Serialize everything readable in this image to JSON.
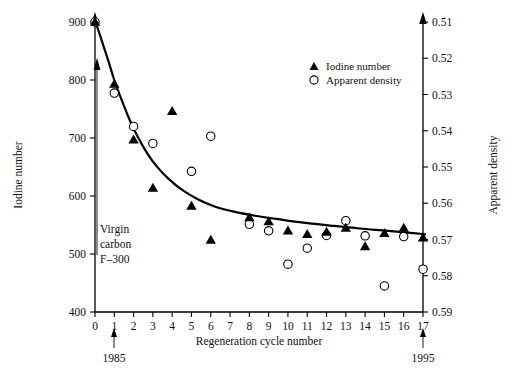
{
  "chart_data": {
    "type": "scatter",
    "title": "",
    "xlabel": "Regeneration cycle number",
    "ylabel": "Iodine number",
    "y2label": "Apparent density",
    "xlim": [
      0,
      17
    ],
    "ylim": [
      400,
      900
    ],
    "y2lim": [
      0.51,
      0.59
    ],
    "y2_inverted": true,
    "grid": false,
    "legend_position": "top-right",
    "x_ticks": [
      "0",
      "1",
      "2",
      "3",
      "4",
      "5",
      "6",
      "7",
      "8",
      "9",
      "10",
      "11",
      "12",
      "13",
      "14",
      "15",
      "16",
      "17"
    ],
    "y_ticks": [
      "400",
      "500",
      "600",
      "700",
      "800",
      "900"
    ],
    "y2_ticks": [
      "0.51",
      "0.52",
      "0.53",
      "0.54",
      "0.55",
      "0.56",
      "0.57",
      "0.58",
      "0.59"
    ],
    "series": [
      {
        "name": "Iodine number",
        "marker": "filled-triangle",
        "axis": "left",
        "x": [
          0,
          1,
          2,
          3,
          4,
          5,
          6,
          8,
          9,
          10,
          11,
          12,
          13,
          14,
          15,
          16,
          17
        ],
        "values": [
          900,
          793,
          697,
          614,
          746,
          583,
          524,
          563,
          556,
          540,
          534,
          538,
          545,
          513,
          536,
          545,
          528
        ]
      },
      {
        "name": "Apparent density",
        "marker": "open-circle",
        "axis": "right",
        "x": [
          0,
          1,
          2,
          3,
          5,
          6,
          8,
          9,
          10,
          11,
          12,
          13,
          14,
          15,
          16,
          17
        ],
        "values": [
          0.51,
          0.5296,
          0.5388,
          0.5435,
          0.5512,
          0.5415,
          0.5658,
          0.5676,
          0.5768,
          0.5724,
          0.5689,
          0.5648,
          0.569,
          0.5828,
          0.5692,
          0.5782
        ]
      }
    ],
    "fit_curve": {
      "name": "exponential-decay-fit",
      "points_x": [
        0.05,
        0.35,
        0.7,
        1.0,
        1.4,
        1.8,
        2.2,
        2.7,
        3.2,
        3.8,
        4.5,
        5.3,
        6.2,
        7.2,
        8.3,
        9.5,
        10.8,
        12.2,
        13.7,
        15.2,
        16.5,
        17.1
      ],
      "points_y": [
        898,
        868,
        832,
        800,
        764,
        731,
        703,
        674,
        651,
        630,
        611,
        595,
        582,
        573,
        566,
        560,
        554,
        549,
        544,
        540,
        536,
        534
      ]
    },
    "annotations": [
      {
        "name": "virgin-carbon",
        "lines": [
          "Virgin",
          "carbon",
          "F–300"
        ],
        "points_to_x": 0,
        "points_to_y": 852
      },
      {
        "name": "year-1985",
        "text": "1985",
        "points_to_x": 1
      },
      {
        "name": "year-1995",
        "text": "1995",
        "points_to_x": 17
      }
    ],
    "legend": [
      {
        "label": "Iodine number",
        "marker": "filled-triangle"
      },
      {
        "label": "Apparent density",
        "marker": "open-circle"
      }
    ]
  }
}
